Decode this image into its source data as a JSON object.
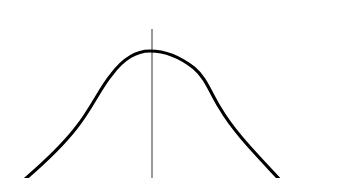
{
  "figure": {
    "type": "bell-curve",
    "caption_cropped": "",
    "curve": {
      "color": "#000000",
      "stroke_width": 3.2,
      "peak": {
        "x": 150,
        "y": 51
      },
      "left_exit": {
        "x": 24,
        "y": 178
      },
      "right_exit": {
        "x": 279,
        "y": 178
      }
    },
    "center_line": {
      "color": "#555555",
      "x": 152,
      "y_top": 29,
      "y_bottom": 178,
      "stroke_width": 1.2
    }
  }
}
